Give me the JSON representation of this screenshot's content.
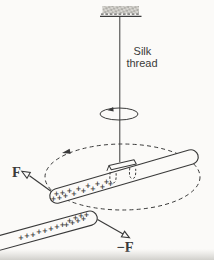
{
  "colors": {
    "ink": "#3a3a3a",
    "paper": "#fbfaf8",
    "page_shadow": "#d7d6d2",
    "mount_fill": "#d9d7d2",
    "mount_speckle": "#85837e"
  },
  "labels": {
    "silk_line1": "Silk",
    "silk_line2": "thread",
    "force_upper": "F",
    "force_lower": "−F"
  },
  "charges": {
    "symbol": "+",
    "suspended_rod_count": 15,
    "held_rod_count": 16
  }
}
